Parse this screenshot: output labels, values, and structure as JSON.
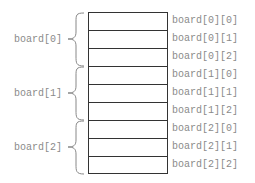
{
  "diagram": {
    "row_groups": [
      {
        "label": "board[0]",
        "elements": [
          "board[0][0]",
          "board[0][1]",
          "board[0][2]"
        ]
      },
      {
        "label": "board[1]",
        "elements": [
          "board[1][0]",
          "board[1][1]",
          "board[1][2]"
        ]
      },
      {
        "label": "board[2]",
        "elements": [
          "board[2][0]",
          "board[2][1]",
          "board[2][2]"
        ]
      }
    ],
    "colors": {
      "line": "#333333",
      "text": "#8a8a8a",
      "brace": "#888888"
    }
  }
}
